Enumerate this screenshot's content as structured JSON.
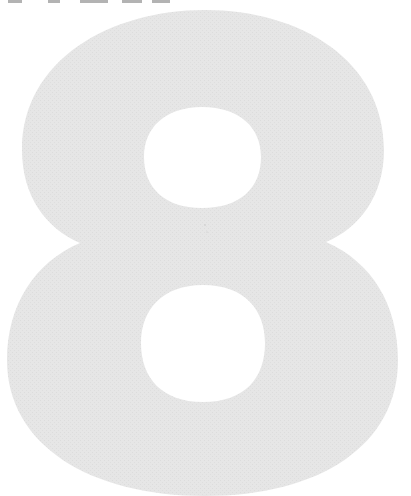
{
  "page": {
    "numeral": "8",
    "numeral_fill_color": "#e6e6e6",
    "background_color": "#ffffff",
    "top_text_cropped": "cropped text (only bottoms of letters visible)"
  }
}
